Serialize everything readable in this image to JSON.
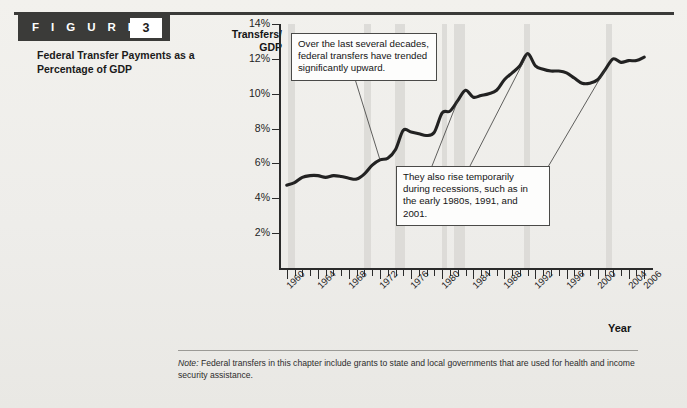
{
  "figure": {
    "label": "F I G U R E",
    "number": "3",
    "title": "Federal Transfer Payments as a Percentage of GDP"
  },
  "note": {
    "prefix": "Note:",
    "text": " Federal transfers in this chapter include grants to state and local governments that are used for health and income security assistance."
  },
  "callouts": [
    {
      "id": "trend",
      "text": "Over the last several decades, federal transfers have trended significantly upward."
    },
    {
      "id": "recessions",
      "text": "They also rise temporarily during recessions, such as in the early 1980s, 1991, and 2001."
    }
  ],
  "chart_data": {
    "type": "line",
    "title": "Federal Transfer Payments as a Percentage of GDP",
    "xlabel": "Year",
    "ylabel": "Transfers/ GDP",
    "ylabel_lines": [
      "Transfers/",
      "GDP"
    ],
    "xlim": [
      1959,
      2007
    ],
    "ylim": [
      0,
      14
    ],
    "yticks": [
      2,
      4,
      6,
      8,
      10,
      12,
      14
    ],
    "ytick_labels": [
      "2%",
      "4%",
      "6%",
      "8%",
      "10%",
      "12%",
      "14%"
    ],
    "xticks": [
      1960,
      1961,
      1962,
      1963,
      1964,
      1965,
      1966,
      1967,
      1968,
      1969,
      1970,
      1971,
      1972,
      1973,
      1974,
      1975,
      1976,
      1977,
      1978,
      1979,
      1980,
      1981,
      1982,
      1983,
      1984,
      1985,
      1986,
      1987,
      1988,
      1989,
      1990,
      1991,
      1992,
      1993,
      1994,
      1995,
      1996,
      1997,
      1998,
      1999,
      2000,
      2001,
      2002,
      2003,
      2004,
      2005,
      2006
    ],
    "xtick_labels": [
      "1960",
      "1964",
      "1968",
      "1972",
      "1976",
      "1980",
      "1984",
      "1988",
      "1992",
      "1996",
      "2000",
      "2004",
      "2006"
    ],
    "xtick_label_years": [
      1960,
      1964,
      1968,
      1972,
      1976,
      1980,
      1984,
      1988,
      1992,
      1996,
      2000,
      2004,
      2006
    ],
    "grid": false,
    "legend": "none",
    "line_color": "#222222",
    "recession_band_color": "#d9d8d5",
    "recession_bands": [
      [
        1960.1,
        1961.1
      ],
      [
        1969.9,
        1970.9
      ],
      [
        1973.9,
        1975.2
      ],
      [
        1980.0,
        1980.6
      ],
      [
        1981.5,
        1982.9
      ],
      [
        1990.5,
        1991.3
      ],
      [
        2001.1,
        2001.9
      ]
    ],
    "x": [
      1960,
      1961,
      1962,
      1963,
      1964,
      1965,
      1966,
      1967,
      1968,
      1969,
      1970,
      1971,
      1972,
      1973,
      1974,
      1975,
      1976,
      1977,
      1978,
      1979,
      1980,
      1981,
      1982,
      1983,
      1984,
      1985,
      1986,
      1987,
      1988,
      1989,
      1990,
      1991,
      1992,
      1993,
      1994,
      1995,
      1996,
      1997,
      1998,
      1999,
      2000,
      2001,
      2002,
      2003,
      2004,
      2005,
      2006
    ],
    "values": [
      4.75,
      4.9,
      5.2,
      5.3,
      5.3,
      5.2,
      5.3,
      5.25,
      5.15,
      5.1,
      5.4,
      5.9,
      6.2,
      6.3,
      6.8,
      7.9,
      7.8,
      7.7,
      7.6,
      7.8,
      8.9,
      9.0,
      9.6,
      10.2,
      9.8,
      9.9,
      10.0,
      10.2,
      10.8,
      11.2,
      11.6,
      12.3,
      11.6,
      11.4,
      11.3,
      11.3,
      11.2,
      10.9,
      10.6,
      10.6,
      10.8,
      11.4,
      12.0,
      11.8,
      11.9,
      11.9,
      12.1
    ],
    "annotations": [
      {
        "text": "Over the last several decades, federal transfers have trended significantly upward.",
        "points_to_year": 1972
      },
      {
        "text": "They also rise temporarily during recessions, such as in the early 1980s, 1991, and 2001.",
        "points_to_years": [
          1982,
          1991,
          2001
        ]
      }
    ]
  }
}
